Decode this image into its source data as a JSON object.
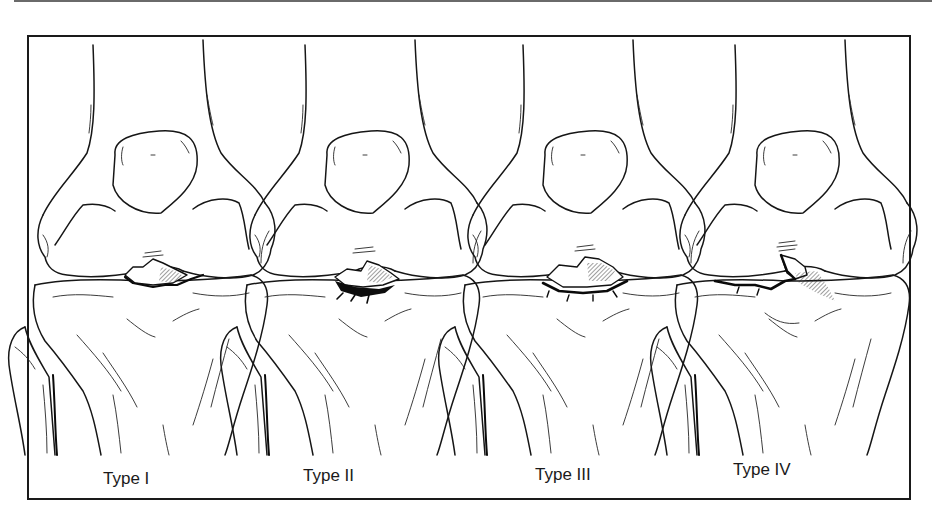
{
  "figure": {
    "panels": [
      {
        "id": "type-1",
        "label": "Type I"
      },
      {
        "id": "type-2",
        "label": "Type II"
      },
      {
        "id": "type-3",
        "label": "Type III"
      },
      {
        "id": "type-4",
        "label": "Type IV"
      }
    ]
  },
  "colors": {
    "ink": "#161616",
    "frame": "#1a1a1a",
    "background": "#ffffff",
    "top_rule": "#6a6a6a"
  }
}
